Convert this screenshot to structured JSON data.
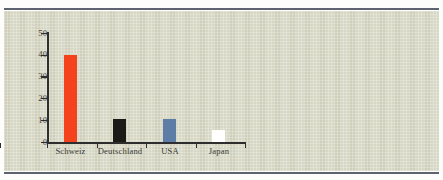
{
  "chart_data": {
    "type": "bar",
    "title": "",
    "subtitle": "",
    "xlabel": "",
    "ylabel": "",
    "categories": [
      "Schweiz",
      "Deutschland",
      "USA",
      "Japan"
    ],
    "values": [
      40,
      10.5,
      10.5,
      5.5
    ],
    "bar_colors": [
      "#f4421d",
      "#1b1a17",
      "#5d7da6",
      "#ffffff"
    ],
    "ylim": [
      0,
      50
    ],
    "yticks": [
      0,
      10,
      20,
      30,
      40,
      50
    ],
    "ytick_labels": [
      "0",
      "10",
      "20",
      "30",
      "40",
      "50"
    ],
    "grid": false,
    "legend": null,
    "legend_position": "none",
    "annotations": [],
    "series": [
      {
        "name": "",
        "values": [
          40,
          10.5,
          10.5,
          5.5
        ]
      }
    ]
  },
  "figure": {
    "panel_background": "#d9d9c6",
    "page_background": "#fdfdfb",
    "axis_color": "#2e2e2e",
    "rule_color": "#5d6470",
    "tick_label_color": "#3b3b38",
    "category_label_color": "#3a3a36"
  }
}
